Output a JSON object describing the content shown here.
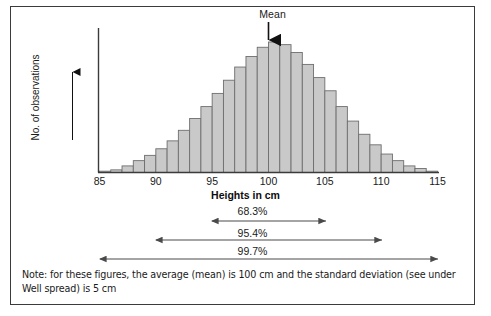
{
  "figure": {
    "mean_label": "Mean",
    "y_axis_label": "No. of observations",
    "x_axis_title": "Heights in cm",
    "note": "Note: for these figures, the average (mean) is 100 cm and the standard deviation (see under Well spread) is 5 cm",
    "bar_fill": "#c9c9c9",
    "bar_stroke": "#6e6e6e",
    "axis_color": "#3b3b3b",
    "border_color": "#3b3b3b",
    "text_color": "#1a1a1a"
  },
  "chart_data": {
    "type": "bar",
    "title": "",
    "xlabel": "Heights in cm",
    "ylabel": "No. of observations",
    "xlim": [
      85,
      115
    ],
    "ylim": [
      0,
      100
    ],
    "grid": false,
    "legend": null,
    "tick_labels": [
      "85",
      "90",
      "95",
      "100",
      "105",
      "110",
      "115"
    ],
    "ticks": [
      85,
      90,
      95,
      100,
      105,
      110,
      115
    ],
    "bin_width": 1,
    "categories": [
      "85",
      "86",
      "87",
      "88",
      "89",
      "90",
      "91",
      "92",
      "93",
      "94",
      "95",
      "96",
      "97",
      "98",
      "99",
      "100",
      "101",
      "102",
      "103",
      "104",
      "105",
      "106",
      "107",
      "108",
      "109",
      "110",
      "111",
      "112",
      "113",
      "114"
    ],
    "values": [
      1,
      2,
      5,
      9,
      13,
      18,
      24,
      32,
      41,
      50,
      60,
      70,
      80,
      88,
      95,
      99,
      97,
      91,
      82,
      72,
      62,
      50,
      39,
      29,
      21,
      14,
      9,
      5,
      3,
      1
    ],
    "annotations": [
      {
        "name": "mean-arrow",
        "label": "Mean",
        "x": 100
      },
      {
        "name": "band-68",
        "label": "68.3%",
        "from": 95,
        "to": 105
      },
      {
        "name": "band-95",
        "label": "95.4%",
        "from": 90,
        "to": 110
      },
      {
        "name": "band-997",
        "label": "99.7%",
        "from": 85,
        "to": 115
      }
    ]
  },
  "bands": [
    {
      "label": "68.3%"
    },
    {
      "label": "95.4%"
    },
    {
      "label": "99.7%"
    }
  ],
  "ticks": [
    {
      "label": "85"
    },
    {
      "label": "90"
    },
    {
      "label": "95"
    },
    {
      "label": "100"
    },
    {
      "label": "105"
    },
    {
      "label": "110"
    },
    {
      "label": "115"
    }
  ]
}
